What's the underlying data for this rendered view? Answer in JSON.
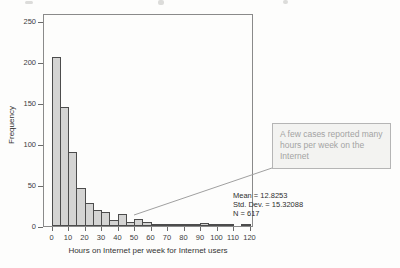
{
  "chart_data": {
    "type": "bar",
    "subtype": "histogram",
    "title": "",
    "xlabel": "Hours on Internet per week for Internet users",
    "ylabel": "Frequency",
    "bin_start": 0,
    "bin_width": 5,
    "bin_edges": [
      0,
      5,
      10,
      15,
      20,
      25,
      30,
      35,
      40,
      45,
      50,
      55,
      60,
      65,
      70,
      75,
      80,
      85,
      90,
      95,
      100,
      105,
      110,
      115,
      120
    ],
    "frequencies": [
      207,
      146,
      90,
      47,
      28,
      20,
      17,
      7,
      15,
      5,
      8,
      5,
      3,
      2,
      3,
      2,
      1,
      1,
      4,
      2,
      1,
      1,
      0,
      2
    ],
    "x_ticks": [
      0,
      10,
      20,
      30,
      40,
      50,
      60,
      70,
      80,
      90,
      100,
      110,
      120
    ],
    "y_ticks": [
      0,
      50,
      100,
      150,
      200,
      250
    ],
    "x_axis_range": [
      -5,
      122
    ],
    "y_axis_range": [
      0,
      260
    ],
    "grid": false,
    "legend": null,
    "bar_fill": "#d4d4d3",
    "bar_border": "#4c4c4c",
    "frame_color": "#8a8a8a"
  },
  "stats": {
    "mean": "Mean = 12.8253",
    "std_dev": "Std. Dev. = 15.32088",
    "n": "N = 617"
  },
  "annotation": {
    "text": "A few cases reported many hours per week on the Internet",
    "border_color": "#b5b5b5",
    "fill_color": "#f3f3f1",
    "text_color": "#a3a3a3",
    "leader_line_color": "#a0a0a0"
  }
}
